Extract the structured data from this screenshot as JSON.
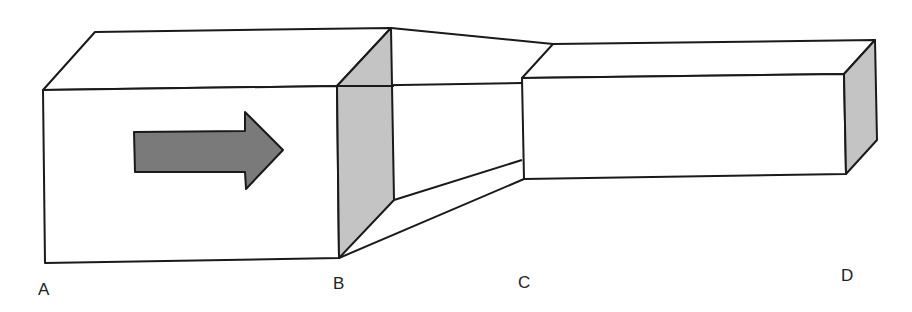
{
  "diagram": {
    "colors": {
      "stroke": "#1a1a1a",
      "side_face": "#c4c4c4",
      "arrow_fill": "#7a7a7a",
      "background": "#ffffff"
    },
    "arrow": {
      "direction": "right",
      "meaning": "flow direction"
    },
    "labels": [
      {
        "id": "A",
        "text": "A"
      },
      {
        "id": "B",
        "text": "B"
      },
      {
        "id": "C",
        "text": "C"
      },
      {
        "id": "D",
        "text": "D"
      }
    ],
    "sections": [
      {
        "name": "wide section",
        "from": "A",
        "to": "B"
      },
      {
        "name": "tapering section",
        "from": "B",
        "to": "C"
      },
      {
        "name": "narrow section",
        "from": "C",
        "to": "D"
      }
    ]
  }
}
